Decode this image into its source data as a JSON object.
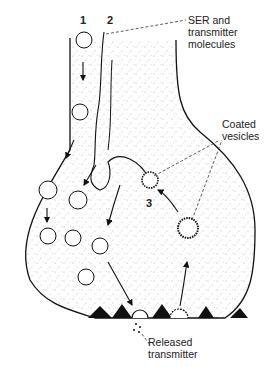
{
  "diagram": {
    "pathway_numbers": [
      "1",
      "2",
      "3"
    ],
    "labels": {
      "ser": [
        "SER and",
        "transmitter",
        "molecules"
      ],
      "coated": [
        "Coated",
        "vesicles"
      ],
      "released": [
        "Released",
        "transmitter"
      ]
    },
    "colors": {
      "ink": "#111111",
      "stipple": "#555555",
      "background": "#ffffff"
    }
  }
}
